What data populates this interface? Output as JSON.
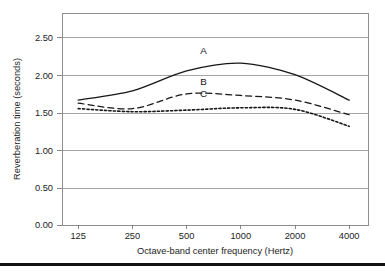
{
  "chart_data": {
    "type": "line",
    "title": "",
    "xlabel": "Octave-band center frequency (Hertz)",
    "ylabel": "Reverberation time (seconds)",
    "x": [
      125,
      250,
      500,
      1000,
      2000,
      4000
    ],
    "xtick_labels": [
      "125",
      "250",
      "500",
      "1000",
      "2000",
      "4000"
    ],
    "x_scale": "log2-octave",
    "ytick_labels": [
      "0.00",
      "0.50",
      "1.00",
      "1.50",
      "2.00",
      "2.50"
    ],
    "ytick_values": [
      0.0,
      0.5,
      1.0,
      1.5,
      2.0,
      2.5
    ],
    "ylim": [
      0.0,
      2.75
    ],
    "grid": "horizontal",
    "legend_position": "inline-annotations",
    "series": [
      {
        "name": "A",
        "label": "A",
        "style": "solid",
        "values": [
          1.62,
          1.74,
          2.0,
          2.1,
          1.95,
          1.62
        ]
      },
      {
        "name": "B",
        "label": "B",
        "style": "dashed",
        "values": [
          1.58,
          1.51,
          1.7,
          1.68,
          1.62,
          1.43
        ]
      },
      {
        "name": "C",
        "label": "C",
        "style": "dotted",
        "values": [
          1.51,
          1.47,
          1.49,
          1.52,
          1.5,
          1.28
        ]
      }
    ],
    "annotations": [
      {
        "text": "A",
        "x": 620,
        "y": 2.22
      },
      {
        "text": "B",
        "x": 620,
        "y": 1.82
      },
      {
        "text": "C",
        "x": 620,
        "y": 1.66
      }
    ],
    "colors": {
      "series_stroke": "#161616",
      "gridline": "#8e8e8e",
      "plot_border": "#8e8e8e",
      "text": "#1c1c1c",
      "background": "#ffffff",
      "bottom_rule": "#111111"
    }
  }
}
